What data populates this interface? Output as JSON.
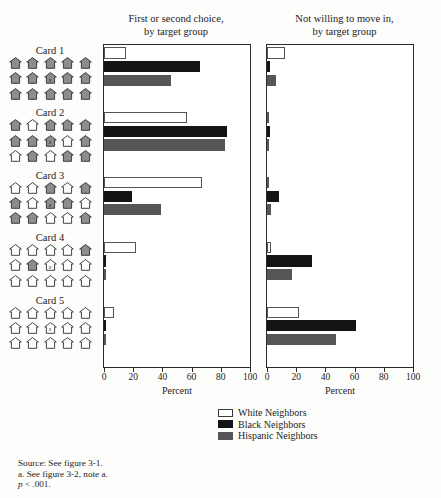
{
  "figure": {
    "top_rule_text": "",
    "source_lines": [
      "Source: See figure 3-1.",
      "a. See figure 3-2, note a."
    ],
    "pvalue_italic": "p",
    "pvalue_rest": " < .001."
  },
  "panels": {
    "left": {
      "title_line1": "First or second choice,",
      "title_line2": "by target group"
    },
    "right": {
      "title_line1": "Not willing to move in,",
      "title_line2": "by target group"
    }
  },
  "axis": {
    "ticks": [
      0,
      20,
      40,
      60,
      80,
      100
    ],
    "tick_labels": [
      "0",
      "20",
      "40",
      "60",
      "80",
      "100"
    ],
    "label": "Percent",
    "min": 0,
    "max": 100
  },
  "legend": {
    "items": [
      {
        "label": "White Neighbors",
        "key": "white",
        "color": "#ffffff"
      },
      {
        "label": "Black Neighbors",
        "key": "black",
        "color": "#141414"
      },
      {
        "label": "Hispanic Neighbors",
        "key": "hisp",
        "color": "#565656"
      }
    ]
  },
  "cards": [
    {
      "label": "Card 1",
      "marked_index": 7,
      "houses": [
        "gray",
        "gray",
        "gray",
        "gray",
        "gray",
        "gray",
        "gray",
        "gray",
        "gray",
        "gray",
        "gray",
        "gray",
        "gray",
        "gray",
        "gray"
      ]
    },
    {
      "label": "Card 2",
      "marked_index": 7,
      "houses": [
        "gray",
        "white",
        "gray",
        "gray",
        "gray",
        "gray",
        "gray",
        "gray",
        "white",
        "gray",
        "white",
        "gray",
        "white",
        "gray",
        "gray"
      ]
    },
    {
      "label": "Card 3",
      "marked_index": 7,
      "houses": [
        "white",
        "white",
        "gray",
        "white",
        "gray",
        "gray",
        "white",
        "gray",
        "gray",
        "white",
        "gray",
        "gray",
        "white",
        "white",
        "gray"
      ]
    },
    {
      "label": "Card 4",
      "marked_index": 7,
      "houses": [
        "white",
        "white",
        "white",
        "white",
        "gray",
        "white",
        "gray",
        "white",
        "white",
        "white",
        "white",
        "white",
        "white",
        "white",
        "white"
      ]
    },
    {
      "label": "Card 5",
      "marked_index": 7,
      "houses": [
        "white",
        "white",
        "white",
        "white",
        "white",
        "white",
        "white",
        "white",
        "white",
        "white",
        "white",
        "white",
        "white",
        "white",
        "white"
      ]
    }
  ],
  "chart_data": {
    "type": "bar",
    "orientation": "horizontal",
    "title": "",
    "xlabel": "Percent",
    "ylabel": "",
    "xlim": [
      0,
      100
    ],
    "grid": false,
    "legend_position": "bottom-right",
    "categories": [
      "Card 1",
      "Card 2",
      "Card 3",
      "Card 4",
      "Card 5"
    ],
    "panels": [
      {
        "name": "First or second choice, by target group",
        "series": [
          {
            "name": "White Neighbors",
            "values": [
              15,
              57,
              67,
              22,
              7
            ]
          },
          {
            "name": "Black Neighbors",
            "values": [
              66,
              84,
              19,
              1,
              0
            ]
          },
          {
            "name": "Hispanic Neighbors",
            "values": [
              46,
              83,
              39,
              0,
              0
            ]
          }
        ]
      },
      {
        "name": "Not willing to move in, by target group",
        "series": [
          {
            "name": "White Neighbors",
            "values": [
              12,
              0,
              0,
              3,
              22
            ]
          },
          {
            "name": "Black Neighbors",
            "values": [
              2,
              2,
              8,
              31,
              61
            ]
          },
          {
            "name": "Hispanic Neighbors",
            "values": [
              6,
              1,
              3,
              17,
              47
            ]
          }
        ]
      }
    ]
  }
}
